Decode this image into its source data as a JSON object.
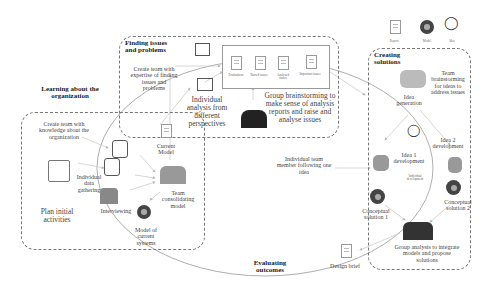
{
  "legend": {
    "report": "Report",
    "model": "Model",
    "idea": "Idea"
  },
  "phases": {
    "learning": {
      "title": "Learning about the organization",
      "create_team": "Create team with knowledge about the organization",
      "plan": "Plan initial activities",
      "individual_data": "Individual data gathering",
      "interviewing": "Interviewing",
      "current_model": "Current Model",
      "team_consolidating": "Team consolidating model",
      "model_current": "Model of current systems"
    },
    "finding": {
      "title": "Finding issues and problems",
      "create_team": "Create team with expertise of finding issues and problems",
      "individual_analysis": "Individual analysis from different perspectives",
      "group_brainstorm": "Group brainstorming to make sense of analysis reports and raise and analyse issues",
      "docs": [
        "Evaluations",
        "Raised issues",
        "Analyzed issues",
        "Important issues"
      ]
    },
    "creating": {
      "title": "Creating solutions",
      "team_brainstorm": "Team brainstorming for ideas to address issues",
      "idea_generation": "Idea generation",
      "idea1": "Idea 1 development",
      "idea2": "Idea 2 development",
      "individual_dev": "Individual development",
      "individual_team": "Individual team member following one idea",
      "concept1": "Conceptual solution 1",
      "concept2": "Conceptual solution 2",
      "group_analysis": "Group analysis to integrate models and propose solutions"
    },
    "evaluating": {
      "title": "Evaluating outcomes",
      "design_brief": "Design brief"
    }
  }
}
